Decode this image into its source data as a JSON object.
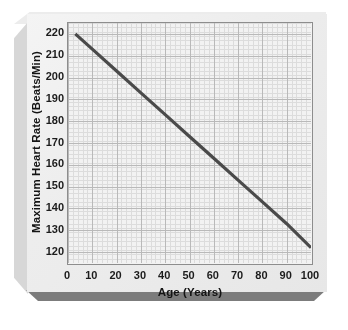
{
  "figure": {
    "background_color": "#ffffff",
    "plaque_face_color": "#eeeeee",
    "plaque_shadow_color": "#7c7c7c",
    "plot_background_color": "#f2f2f2",
    "frame_color": "#8d8d8d"
  },
  "chart_data": {
    "type": "line",
    "title": "Maximum Heart Rate (Beats/Min) vs Age (Years)",
    "xlabel": "Age (Years)",
    "ylabel": "Maximum Heart Rate (Beats/Min)",
    "xlim": [
      0,
      100
    ],
    "ylim": [
      115,
      225
    ],
    "xticks": [
      0,
      10,
      20,
      30,
      40,
      50,
      60,
      70,
      80,
      90,
      100
    ],
    "xticklabels": [
      "0",
      "10",
      "20",
      "30",
      "40",
      "50",
      "60",
      "70",
      "80",
      "90",
      "100"
    ],
    "yticks": [
      120,
      130,
      140,
      150,
      160,
      170,
      180,
      190,
      200,
      210,
      220
    ],
    "yticklabels": [
      "120",
      "130",
      "140",
      "150",
      "160",
      "170",
      "180",
      "190",
      "200",
      "210",
      "220"
    ],
    "grid": true,
    "grid_major_color": "#b9b9b9",
    "grid_minor_color": "#dcdcdc",
    "grid_minor_per_major": 5,
    "legend": false,
    "legend_position": "none",
    "annotations": [],
    "series": [
      {
        "name": "Maximum Heart Rate",
        "color": "#4a4a4a",
        "linewidth": 3.2,
        "x": [
          3,
          10,
          20,
          30,
          40,
          50,
          60,
          70,
          80,
          90,
          100
        ],
        "values": [
          220,
          213,
          203,
          193,
          183,
          173,
          163,
          153,
          143,
          133,
          122
        ]
      }
    ]
  }
}
